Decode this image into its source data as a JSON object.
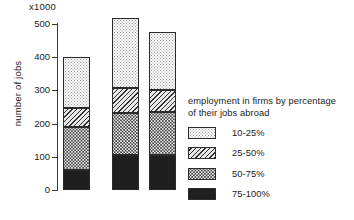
{
  "chart_data": {
    "type": "bar",
    "subtype": "stacked",
    "title": "",
    "xlabel": "",
    "ylabel": "number of jobs",
    "unit_label": "x1000",
    "ylim": [
      0,
      500
    ],
    "yticks": [
      0,
      100,
      200,
      300,
      400,
      500
    ],
    "ytick_labels": [
      "0",
      "100",
      "200",
      "300",
      "400",
      "500"
    ],
    "grid": false,
    "categories": [
      "1",
      "2",
      "3"
    ],
    "category_labels_visible": false,
    "legend_title": "employment in firms by percentage of their jobs abroad",
    "legend_position": "right",
    "series": [
      {
        "name": "75-100%",
        "pattern": "solid-black",
        "values": [
          60,
          105,
          105
        ]
      },
      {
        "name": "50-75%",
        "pattern": "dotted-dark",
        "values": [
          130,
          127,
          130
        ]
      },
      {
        "name": "25-50%",
        "pattern": "diagonal-hatch",
        "values": [
          57,
          75,
          66
        ]
      },
      {
        "name": "10-25%",
        "pattern": "light-stipple",
        "values": [
          153,
          211,
          175
        ]
      }
    ],
    "totals": [
      400,
      518,
      476
    ]
  },
  "axis": {
    "unit_label": "x1000",
    "y_axis_label": "number of jobs",
    "ticks": [
      {
        "label": "500",
        "value": 500
      },
      {
        "label": "400",
        "value": 400
      },
      {
        "label": "300",
        "value": 300
      },
      {
        "label": "200",
        "value": 200
      },
      {
        "label": "100",
        "value": 100
      },
      {
        "label": "0",
        "value": 0
      }
    ]
  },
  "legend": {
    "title_line1": "employment in firms by percentage",
    "title_line2": "of their jobs abroad",
    "items": [
      {
        "label": "10-25%",
        "pattern": "light-stipple"
      },
      {
        "label": "25-50%",
        "pattern": "diagonal-hatch"
      },
      {
        "label": "50-75%",
        "pattern": "dotted-dark"
      },
      {
        "label": "75-100%",
        "pattern": "solid-black"
      }
    ]
  },
  "colors": {
    "axis": "#3a3a3a",
    "outline": "#2b2b2b",
    "text": "#1a1a1a",
    "background": "#ffffff",
    "fill_75_100": "#201f1f",
    "fill_50_75": "#3d3d3d",
    "fill_25_50": "#e8e8e8",
    "fill_10_25": "#fbfbfb"
  }
}
